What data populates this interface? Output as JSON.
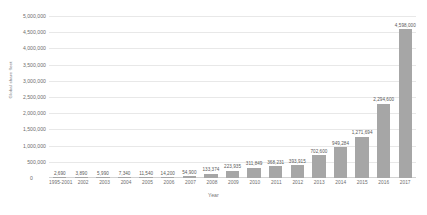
{
  "chart_data": {
    "type": "bar",
    "title": "",
    "xlabel": "Year",
    "ylabel": "Global share fleet",
    "ylim": [
      0,
      5000000
    ],
    "ytick_step": 500000,
    "grid": true,
    "legend": "none",
    "bar_color": "#a6a6a6",
    "grid_color": "#e8e8e8",
    "categories": [
      "1995-2001",
      "2002",
      "2003",
      "2004",
      "2005",
      "2006",
      "2007",
      "2008",
      "2009",
      "2010",
      "2011",
      "2012",
      "2013",
      "2014",
      "2015",
      "2016",
      "2017"
    ],
    "values": [
      2690,
      3890,
      5990,
      7340,
      11540,
      14200,
      54900,
      133374,
      223935,
      311849,
      368231,
      393915,
      702600,
      949284,
      1271694,
      2294600,
      4598000
    ],
    "value_labels": [
      "2,690",
      "3,890",
      "5,990",
      "7,340",
      "11,540",
      "14,200",
      "54,900",
      "133,374",
      "223,935",
      "311,849",
      "368,231",
      "393,915",
      "702,600",
      "949,284",
      "1,271,694",
      "2,294,600",
      "4,598,000"
    ],
    "ytick_labels": [
      "5,000,000",
      "4,500,000",
      "4,000,000",
      "3,500,000",
      "3,000,000",
      "2,500,000",
      "2,000,000",
      "1,500,000",
      "1,000,000",
      "500,000",
      "0"
    ],
    "ytick_values": [
      5000000,
      4500000,
      4000000,
      3500000,
      3000000,
      2500000,
      2000000,
      1500000,
      1000000,
      500000,
      0
    ]
  }
}
